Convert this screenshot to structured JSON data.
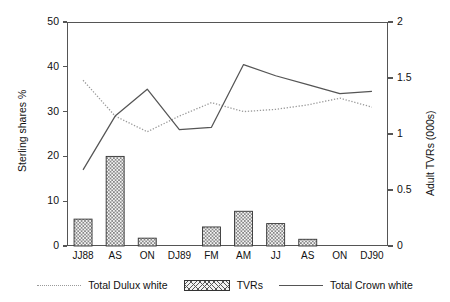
{
  "chart_data": {
    "type": "bar",
    "title": "",
    "categories": [
      "JJ88",
      "AS",
      "ON",
      "DJ89",
      "FM",
      "AM",
      "JJ",
      "AS",
      "ON",
      "DJ90"
    ],
    "xlabel": "",
    "ylabel": "Sterling shares %",
    "ylabel_right": "Adult TVRs (000s)",
    "ylim": [
      0,
      50
    ],
    "ylim_right": [
      0,
      2
    ],
    "yticks": [
      "0",
      "10",
      "20",
      "30",
      "40",
      "50"
    ],
    "ytick_values": [
      0,
      10,
      20,
      30,
      40,
      50
    ],
    "yticks_right": [
      "0",
      "0.5",
      "1",
      "1.5",
      "2"
    ],
    "ytick_values_right": [
      0,
      0.5,
      1,
      1.5,
      2
    ],
    "grid": false,
    "legend_position": "bottom",
    "series": [
      {
        "name": "Total Dulux white",
        "axis": "left",
        "style": "dotted-line",
        "color": "#9a9a9a",
        "values": [
          37,
          29,
          25.5,
          29,
          32,
          30,
          30.5,
          31.5,
          33,
          31
        ]
      },
      {
        "name": "TVRs",
        "axis": "right",
        "style": "bar",
        "color": "#555555",
        "values": [
          0.24,
          0.8,
          0.07,
          0,
          0.17,
          0.31,
          0.2,
          0.06,
          0,
          0
        ]
      },
      {
        "name": "Total Crown white",
        "axis": "left",
        "style": "solid-line",
        "color": "#555555",
        "values": [
          17,
          29,
          35,
          26,
          26.5,
          40.5,
          38,
          36,
          34,
          34.5
        ]
      }
    ]
  },
  "legend": {
    "items": [
      {
        "label": "Total Dulux white",
        "swatch": "dotted-line-swatch"
      },
      {
        "label": "TVRs",
        "swatch": "hatched-bar-swatch"
      },
      {
        "label": "Total Crown white",
        "swatch": "solid-line-swatch"
      }
    ]
  },
  "colors": {
    "axis": "#555555",
    "dotted_series": "#9a9a9a",
    "solid_series": "#555555",
    "bar_edge": "#333333",
    "bar_fill": "#f2f2f2",
    "background": "#ffffff"
  }
}
